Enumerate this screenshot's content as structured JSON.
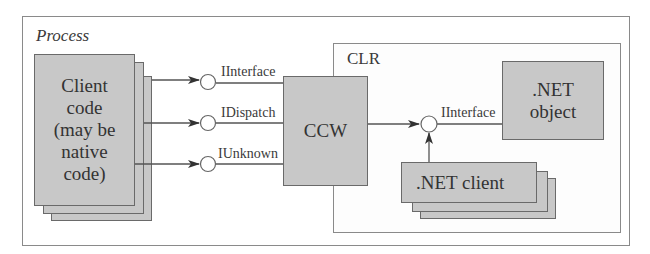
{
  "diagram": {
    "process": {
      "label": "Process"
    },
    "client": {
      "lines": [
        "Client",
        "code",
        "(may be",
        "native",
        "code)"
      ]
    },
    "interfaces": [
      {
        "label": "IInterface"
      },
      {
        "label": "IDispatch"
      },
      {
        "label": "IUnknown"
      }
    ],
    "ccw": {
      "label": "CCW"
    },
    "clr": {
      "label": "CLR",
      "net_object": {
        "lines": [
          ".NET",
          "object"
        ]
      },
      "interface": {
        "label": "IInterface"
      },
      "net_client": {
        "label": ".NET client"
      }
    },
    "colors": {
      "box_fill": "#c8c8c8",
      "box_stroke": "#6a6a6a",
      "frame_stroke": "#8a8a8a",
      "line": "#555555",
      "arrow": "#333333",
      "background": "#ffffff"
    }
  }
}
